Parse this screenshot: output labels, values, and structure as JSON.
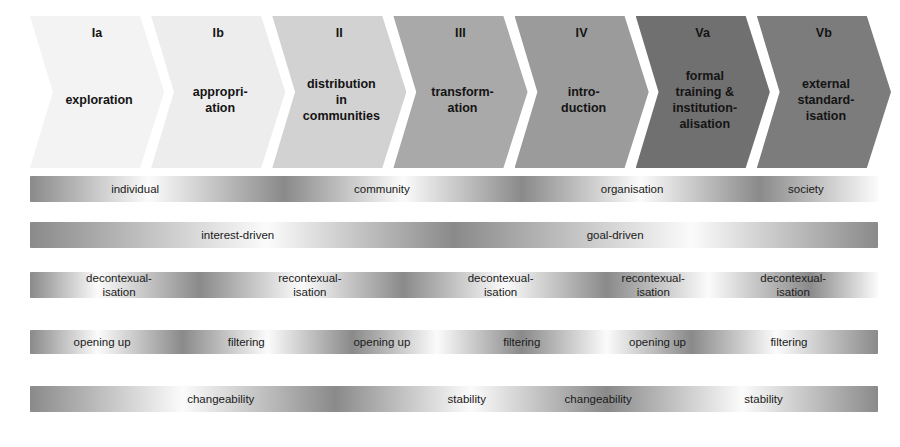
{
  "diagram": {
    "background": "#ffffff",
    "phases": [
      {
        "roman": "Ia",
        "label": "exploration",
        "color": "#f3f3f3"
      },
      {
        "roman": "Ib",
        "label": "appropri-\nation",
        "color": "#ededed"
      },
      {
        "roman": "II",
        "label": "distribution\nin\ncommunities",
        "color": "#d2d2d2"
      },
      {
        "roman": "III",
        "label": "transform-\nation",
        "color": "#a9a9a9"
      },
      {
        "roman": "IV",
        "label": "intro-\nduction",
        "color": "#9b9b9b"
      },
      {
        "roman": "Va",
        "label": "formal\ntraining &\ninstitution-\nalisation",
        "color": "#707070"
      },
      {
        "roman": "Vb",
        "label": "external\nstandard-\nisation",
        "color": "#7c7c7c"
      }
    ],
    "dimensions": [
      {
        "name": "scope",
        "height": 26,
        "dark": "#8a8a8a",
        "light": "#fbfbfb",
        "stops": [
          0,
          14,
          30,
          44,
          58,
          72,
          86,
          100
        ],
        "labels": [
          {
            "text": "individual",
            "x": 12.4
          },
          {
            "text": "community",
            "x": 41.5
          },
          {
            "text": "organisation",
            "x": 71.0
          },
          {
            "text": "society",
            "x": 91.5
          }
        ]
      },
      {
        "name": "motivation",
        "height": 26,
        "dark": "#8a8a8a",
        "light": "#fbfbfb",
        "stops": [
          0,
          28,
          50,
          78,
          100
        ],
        "labels": [
          {
            "text": "interest-driven",
            "x": 24.5
          },
          {
            "text": "goal-driven",
            "x": 69.0
          }
        ]
      },
      {
        "name": "contextualisation",
        "height": 26,
        "dark": "#8a8a8a",
        "light": "#fbfbfb",
        "stops": [
          0,
          8,
          20,
          32,
          44,
          56,
          68,
          80,
          92,
          100
        ],
        "labels": [
          {
            "text": "decontexual-\nisation",
            "x": 10.5
          },
          {
            "text": "recontexual-\nisation",
            "x": 33.0
          },
          {
            "text": "decontexual-\nisation",
            "x": 55.5
          },
          {
            "text": "recontexual-\nisation",
            "x": 73.5
          },
          {
            "text": "decontexual-\nisation",
            "x": 90.0
          }
        ]
      },
      {
        "name": "scoping",
        "height": 24,
        "dark": "#8a8a8a",
        "light": "#fbfbfb",
        "stops": [
          0,
          8,
          18,
          28,
          38,
          48,
          58,
          68,
          78,
          88,
          100
        ],
        "labels": [
          {
            "text": "opening up",
            "x": 8.5
          },
          {
            "text": "filtering",
            "x": 25.5
          },
          {
            "text": "opening up",
            "x": 41.5
          },
          {
            "text": "filtering",
            "x": 58.0
          },
          {
            "text": "opening up",
            "x": 74.0
          },
          {
            "text": "filtering",
            "x": 89.5
          }
        ]
      },
      {
        "name": "stability",
        "height": 26,
        "dark": "#8a8a8a",
        "light": "#fbfbfb",
        "stops": [
          0,
          18,
          36,
          52,
          68,
          84,
          100
        ],
        "labels": [
          {
            "text": "changeability",
            "x": 22.5
          },
          {
            "text": "stability",
            "x": 51.5
          },
          {
            "text": "changeability",
            "x": 67.0
          },
          {
            "text": "stability",
            "x": 86.5
          }
        ]
      }
    ],
    "bar_tops": [
      176,
      222,
      272,
      330,
      386
    ]
  }
}
